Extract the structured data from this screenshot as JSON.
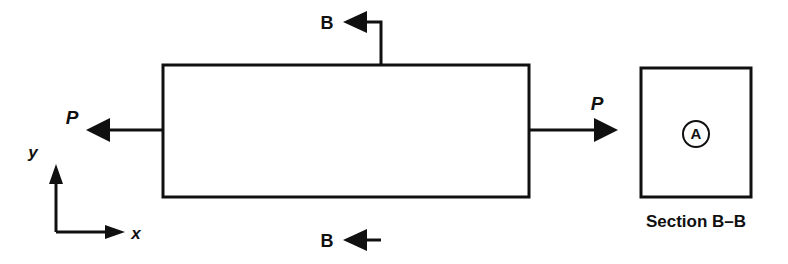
{
  "figure": {
    "background_color": "#ffffff",
    "ink_color": "#101010",
    "width": 788,
    "height": 264
  },
  "bar": {
    "name": "prismatic-bar",
    "left": 163,
    "top": 65,
    "right": 529,
    "bottom": 197,
    "stroke_width": 3
  },
  "loads": [
    {
      "id": "load-left",
      "label": "P",
      "direction": "left",
      "line_y": 130,
      "tail_x": 163,
      "tip_x": 86,
      "label_x": 72,
      "label_y": 124,
      "font_size": 19
    },
    {
      "id": "load-right",
      "label": "P",
      "direction": "right",
      "line_y": 130,
      "tail_x": 529,
      "tip_x": 618,
      "label_x": 597,
      "label_y": 110,
      "font_size": 19
    }
  ],
  "section_cuts": [
    {
      "id": "section-cut-top",
      "label": "B",
      "stem_x": 381,
      "stem_from_y": 22,
      "stem_to_y": 65,
      "arrow_y": 22,
      "tip_x": 343,
      "label_x": 327,
      "label_y": 29,
      "font_size": 18
    },
    {
      "id": "section-cut-bottom",
      "label": "B",
      "stem_x": 381,
      "stem_from_y": 197,
      "stem_to_y": 240,
      "arrow_y": 240,
      "tip_x": 343,
      "label_x": 327,
      "label_y": 247,
      "font_size": 18
    }
  ],
  "axes": {
    "origin_x": 56,
    "origin_y": 232,
    "y_tip_y": 164,
    "x_tip_x": 125,
    "x_label": "x",
    "y_label": "y",
    "x_label_x": 136,
    "x_label_y": 239,
    "y_label_x": 33,
    "y_label_y": 158,
    "font_size": 17
  },
  "section_view": {
    "box_left": 641,
    "box_top": 68,
    "box_right": 751,
    "box_bottom": 197,
    "stroke_width": 3,
    "point_marker": {
      "label": "A",
      "center_x": 696,
      "center_y": 134,
      "radius": 13,
      "stroke_width": 2,
      "font_size": 15
    },
    "caption": "Section B–B",
    "caption_x": 696,
    "caption_y": 227,
    "caption_font_size": 17
  }
}
